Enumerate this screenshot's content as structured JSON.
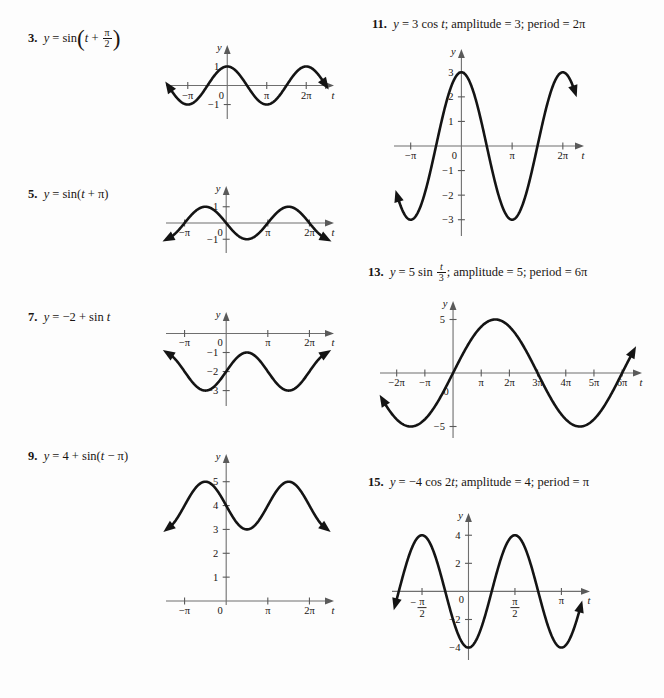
{
  "page": {
    "background": "#fdfdfd",
    "ink": "#141414",
    "axis_color": "#6f6f6f",
    "layout": "two-column exercise answer page of trigonometric graphs"
  },
  "problems": [
    {
      "number": "3.",
      "equation_parts": {
        "lhs": "y",
        "eq": "=",
        "fn": "sin",
        "arg_var": "t",
        "plus": "+",
        "frac_num": "π",
        "frac_den": "2"
      },
      "equation_text": "y = sin(t + π/2)",
      "axis_labels": {
        "y": "y",
        "x": "t"
      },
      "x_ticks": [
        "−π",
        "0",
        "π",
        "2π"
      ],
      "y_ticks": [
        "1",
        "−1"
      ],
      "chart_data": {
        "type": "line",
        "title": "y = sin(t + π/2)",
        "xlabel": "t",
        "ylabel": "y",
        "amplitude": 1,
        "vertical_shift": 0,
        "phase_shift_rad": 1.5707963,
        "angular_frequency": 1,
        "form": "sin",
        "xlim_pi": [
          -1.45,
          2.45
        ],
        "ylim": [
          -1,
          1
        ],
        "x_tick_values_pi": [
          -1,
          0,
          1,
          2
        ],
        "y_tick_values": [
          1,
          -1
        ],
        "grid": false,
        "key_points": [
          {
            "t_pi": -1.0,
            "y": -1.0
          },
          {
            "t_pi": -0.5,
            "y": 0.0
          },
          {
            "t_pi": 0.0,
            "y": 1.0
          },
          {
            "t_pi": 0.5,
            "y": 0.0
          },
          {
            "t_pi": 1.0,
            "y": -1.0
          },
          {
            "t_pi": 1.5,
            "y": 0.0
          },
          {
            "t_pi": 2.0,
            "y": 1.0
          }
        ]
      }
    },
    {
      "number": "5.",
      "equation_text": "y = sin(t + π)",
      "axis_labels": {
        "y": "y",
        "x": "t"
      },
      "x_ticks": [
        "−π",
        "0",
        "π",
        "2π"
      ],
      "y_ticks": [
        "1",
        "−1"
      ],
      "chart_data": {
        "type": "line",
        "title": "y = sin(t + π)",
        "xlabel": "t",
        "ylabel": "y",
        "amplitude": 1,
        "vertical_shift": 0,
        "phase_shift_rad": 3.1415927,
        "angular_frequency": 1,
        "form": "sin",
        "xlim_pi": [
          -1.35,
          2.35
        ],
        "ylim": [
          -1,
          1
        ],
        "x_tick_values_pi": [
          -1,
          0,
          1,
          2
        ],
        "y_tick_values": [
          1,
          -1
        ],
        "grid": false,
        "key_points": [
          {
            "t_pi": -1.0,
            "y": 0.0
          },
          {
            "t_pi": -0.5,
            "y": 1.0
          },
          {
            "t_pi": 0.0,
            "y": 0.0
          },
          {
            "t_pi": 0.5,
            "y": -1.0
          },
          {
            "t_pi": 1.0,
            "y": 0.0
          },
          {
            "t_pi": 1.5,
            "y": 1.0
          },
          {
            "t_pi": 2.0,
            "y": 0.0
          }
        ]
      }
    },
    {
      "number": "7.",
      "equation_text": "y = −2 + sin t",
      "axis_labels": {
        "y": "y",
        "x": "t"
      },
      "x_ticks": [
        "−π",
        "0",
        "π",
        "2π"
      ],
      "y_ticks": [
        "−1",
        "−2",
        "−3"
      ],
      "chart_data": {
        "type": "line",
        "title": "y = −2 + sin t",
        "xlabel": "t",
        "ylabel": "y",
        "amplitude": 1,
        "vertical_shift": -2,
        "phase_shift_rad": 0,
        "angular_frequency": 1,
        "form": "sin",
        "xlim_pi": [
          -1.35,
          2.35
        ],
        "ylim": [
          -3,
          0
        ],
        "x_tick_values_pi": [
          -1,
          0,
          1,
          2
        ],
        "y_tick_values": [
          -1,
          -2,
          -3
        ],
        "grid": false,
        "key_points": [
          {
            "t_pi": -1.0,
            "y": -2.0
          },
          {
            "t_pi": -0.5,
            "y": -3.0
          },
          {
            "t_pi": 0.0,
            "y": -2.0
          },
          {
            "t_pi": 0.5,
            "y": -1.0
          },
          {
            "t_pi": 1.0,
            "y": -2.0
          },
          {
            "t_pi": 1.5,
            "y": -3.0
          },
          {
            "t_pi": 2.0,
            "y": -2.0
          }
        ]
      }
    },
    {
      "number": "9.",
      "equation_text": "y = 4 + sin(t − π)",
      "axis_labels": {
        "y": "y",
        "x": "t"
      },
      "x_ticks": [
        "−π",
        "0",
        "π",
        "2π"
      ],
      "y_ticks": [
        "5",
        "4",
        "3",
        "2",
        "1"
      ],
      "chart_data": {
        "type": "line",
        "title": "y = 4 + sin(t − π)",
        "xlabel": "t",
        "ylabel": "y",
        "amplitude": 1,
        "vertical_shift": 4,
        "phase_shift_rad": -3.1415927,
        "angular_frequency": 1,
        "form": "sin",
        "xlim_pi": [
          -1.35,
          2.35
        ],
        "ylim": [
          0,
          5
        ],
        "x_tick_values_pi": [
          -1,
          0,
          1,
          2
        ],
        "y_tick_values": [
          5,
          4,
          3,
          2,
          1
        ],
        "grid": false,
        "key_points": [
          {
            "t_pi": -1.0,
            "y": 4.0
          },
          {
            "t_pi": -0.5,
            "y": 5.0
          },
          {
            "t_pi": 0.0,
            "y": 4.0
          },
          {
            "t_pi": 0.5,
            "y": 3.0
          },
          {
            "t_pi": 1.0,
            "y": 4.0
          },
          {
            "t_pi": 1.5,
            "y": 5.0
          },
          {
            "t_pi": 2.0,
            "y": 4.0
          }
        ]
      }
    },
    {
      "number": "11.",
      "equation_text": "y = 3 cos t; amplitude = 3; period = 2π",
      "amplitude_label": "amplitude = 3",
      "period_label": "period = 2π",
      "axis_labels": {
        "y": "y",
        "x": "t"
      },
      "x_ticks": [
        "−π",
        "0",
        "π",
        "2π"
      ],
      "y_ticks": [
        "3",
        "2",
        "1",
        "−1",
        "−2",
        "−3"
      ],
      "chart_data": {
        "type": "line",
        "title": "y = 3 cos t",
        "xlabel": "t",
        "ylabel": "y",
        "amplitude": 3,
        "vertical_shift": 0,
        "phase_shift_rad": 1.5707963,
        "angular_frequency": 1,
        "form": "sin",
        "period_pi": 2,
        "xlim_pi": [
          -1.25,
          2.22
        ],
        "ylim": [
          -3,
          3
        ],
        "x_tick_values_pi": [
          -1,
          0,
          1,
          2
        ],
        "y_tick_values": [
          3,
          2,
          1,
          -1,
          -2,
          -3
        ],
        "grid": false,
        "key_points": [
          {
            "t_pi": -1.0,
            "y": -3.0
          },
          {
            "t_pi": -0.5,
            "y": 0.0
          },
          {
            "t_pi": 0.0,
            "y": 3.0
          },
          {
            "t_pi": 0.5,
            "y": 0.0
          },
          {
            "t_pi": 1.0,
            "y": -3.0
          },
          {
            "t_pi": 1.5,
            "y": 0.0
          },
          {
            "t_pi": 2.0,
            "y": 3.0
          }
        ]
      }
    },
    {
      "number": "13.",
      "equation_text": "y = 5 sin t/3; amplitude = 5; period = 6π",
      "amplitude_label": "amplitude = 5",
      "period_label": "period = 6π",
      "frac_num": "t",
      "frac_den": "3",
      "axis_labels": {
        "y": "y",
        "x": "t"
      },
      "x_ticks": [
        "−2π",
        "−π",
        "0",
        "π",
        "2π",
        "3π",
        "4π",
        "5π",
        "6π"
      ],
      "y_ticks": [
        "5",
        "−5"
      ],
      "chart_data": {
        "type": "line",
        "title": "y = 5 sin(t/3)",
        "xlabel": "t",
        "ylabel": "y",
        "amplitude": 5,
        "vertical_shift": 0,
        "phase_shift_rad": 0,
        "angular_frequency": 0.3333333,
        "form": "sin",
        "period_pi": 6,
        "xlim_pi": [
          -2.45,
          6.35
        ],
        "ylim": [
          -5,
          5
        ],
        "x_tick_values_pi": [
          -2,
          -1,
          0,
          1,
          2,
          3,
          4,
          5,
          6
        ],
        "y_tick_values": [
          5,
          -5
        ],
        "grid": false,
        "key_points": [
          {
            "t_pi": -3.0,
            "y": -5.0
          },
          {
            "t_pi": -1.5,
            "y": -5.0
          },
          {
            "t_pi": 0.0,
            "y": 0.0
          },
          {
            "t_pi": 1.5,
            "y": 5.0
          },
          {
            "t_pi": 3.0,
            "y": 0.0
          },
          {
            "t_pi": 4.5,
            "y": -5.0
          },
          {
            "t_pi": 6.0,
            "y": 0.0
          }
        ]
      }
    },
    {
      "number": "15.",
      "equation_text": "y = −4 cos 2t; amplitude = 4; period = π",
      "amplitude_label": "amplitude = 4",
      "period_label": "period = π",
      "axis_labels": {
        "y": "y",
        "x": "t"
      },
      "x_ticks": [
        "−π/2",
        "0",
        "π/2",
        "π"
      ],
      "x_tick_fractions": [
        {
          "sign": "−",
          "num": "π",
          "den": "2"
        },
        {
          "sign": "",
          "num": "π",
          "den": "2"
        }
      ],
      "y_ticks": [
        "4",
        "2",
        "−2",
        "−4"
      ],
      "chart_data": {
        "type": "line",
        "title": "y = −4 cos 2t",
        "xlabel": "t",
        "ylabel": "y",
        "amplitude": -4,
        "vertical_shift": 0,
        "phase_shift_rad": 1.5707963,
        "angular_frequency": 2,
        "form": "sin",
        "period_pi": 1,
        "xlim_pi": [
          -0.78,
          1.2
        ],
        "ylim": [
          -4,
          4
        ],
        "x_tick_values_pi": [
          -0.5,
          0,
          0.5,
          1
        ],
        "y_tick_values": [
          4,
          2,
          -2,
          -4
        ],
        "grid": false,
        "key_points": [
          {
            "t_pi": -0.75,
            "y": 0.0
          },
          {
            "t_pi": -0.5,
            "y": 4.0
          },
          {
            "t_pi": -0.25,
            "y": 0.0
          },
          {
            "t_pi": 0.0,
            "y": -4.0
          },
          {
            "t_pi": 0.25,
            "y": 0.0
          },
          {
            "t_pi": 0.5,
            "y": 4.0
          },
          {
            "t_pi": 0.75,
            "y": 0.0
          },
          {
            "t_pi": 1.0,
            "y": -4.0
          }
        ]
      }
    }
  ]
}
